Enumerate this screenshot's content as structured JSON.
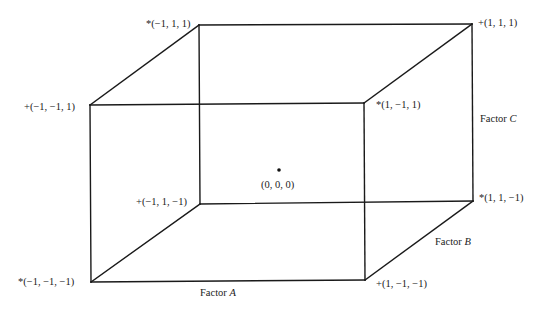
{
  "diagram": {
    "type": "2^3 factorial design cube",
    "vertices": [
      {
        "id": "v_m1_m1_p1",
        "label": "+(−1, −1, 1)",
        "x": 90,
        "y": 105
      },
      {
        "id": "v_m1_p1_p1",
        "label": "*(−1, 1, 1)",
        "x": 199,
        "y": 25
      },
      {
        "id": "v_p1_p1_p1",
        "label": "+(1, 1, 1)",
        "x": 472,
        "y": 24
      },
      {
        "id": "v_p1_m1_p1",
        "label": "*(1, −1, 1)",
        "x": 364,
        "y": 103
      },
      {
        "id": "v_m1_p1_m1",
        "label": "+(−1, 1, −1)",
        "x": 200,
        "y": 204
      },
      {
        "id": "v_p1_p1_m1",
        "label": "*(1, 1, −1)",
        "x": 473,
        "y": 201
      },
      {
        "id": "v_m1_m1_m1",
        "label": "*(−1, −1, −1)",
        "x": 91,
        "y": 282
      },
      {
        "id": "v_p1_m1_m1",
        "label": "+(1, −1, −1)",
        "x": 365,
        "y": 280
      }
    ],
    "center": {
      "label": "(0, 0, 0)",
      "x": 279,
      "y": 170
    },
    "axes": {
      "factor_a": {
        "label": "Factor ",
        "var": "A"
      },
      "factor_b": {
        "label": "Factor ",
        "var": "B"
      },
      "factor_c": {
        "label": "Factor ",
        "var": "C"
      }
    },
    "colors": {
      "line": "#1a1a1a",
      "text": "#222222",
      "background": "#ffffff"
    }
  }
}
